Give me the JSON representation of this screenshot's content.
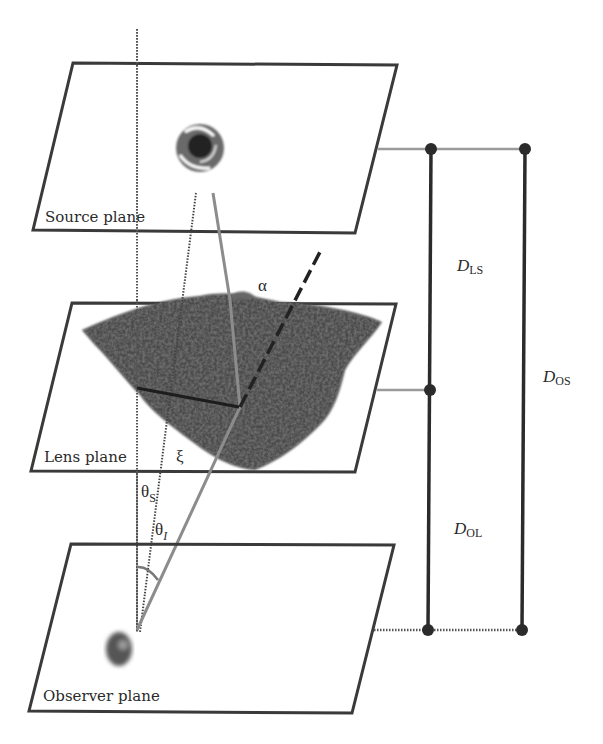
{
  "diagram": {
    "planes": [
      {
        "id": "source",
        "label": "Source plane"
      },
      {
        "id": "lens",
        "label": "Lens plane"
      },
      {
        "id": "observer",
        "label": "Observer plane"
      }
    ],
    "angles": {
      "alpha": "α",
      "xi": "ξ",
      "theta_s": "θ",
      "theta_s_sub": "S",
      "theta_i": "θ",
      "theta_i_sub": "I"
    },
    "distances": [
      {
        "id": "ls",
        "main": "D",
        "sub": "LS"
      },
      {
        "id": "os",
        "main": "D",
        "sub": "OS"
      },
      {
        "id": "ol",
        "main": "D",
        "sub": "OL"
      }
    ],
    "colors": {
      "plane_border": "#3a3a3a",
      "ray_solid": "#8a8a8a",
      "scale_bar": "#2b2b2b",
      "lens_cloud": "#4a4a4a",
      "connector": "#9a9a9a"
    }
  }
}
